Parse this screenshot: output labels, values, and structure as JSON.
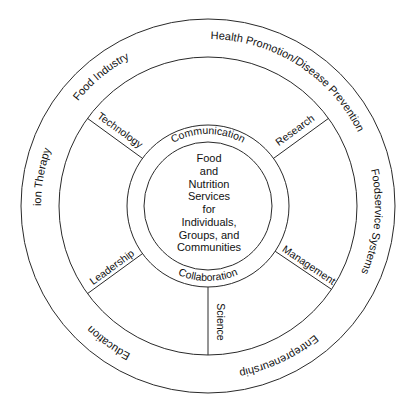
{
  "diagram": {
    "center": {
      "lines": [
        "Food",
        "and",
        "Nutrition",
        "Services",
        "for",
        "Individuals,",
        "Groups, and",
        "Communities"
      ]
    },
    "inner_ring": {
      "top": "Communication",
      "bottom": "Collaboration"
    },
    "spokes": [
      {
        "label": "Technology",
        "position": "upper-left"
      },
      {
        "label": "Research",
        "position": "upper-right"
      },
      {
        "label": "Management",
        "position": "lower-right"
      },
      {
        "label": "Science",
        "position": "bottom"
      },
      {
        "label": "Leadership",
        "position": "lower-left"
      }
    ],
    "outer_ring": [
      {
        "label": "Health Promotion/Disease Prevention",
        "position": "top-right"
      },
      {
        "label": "Foodservice Systems",
        "position": "right"
      },
      {
        "label": "Entrepreneurship",
        "position": "bottom-right"
      },
      {
        "label": "Education",
        "position": "bottom-left"
      },
      {
        "label": "Nutrition Therapy",
        "position": "left"
      },
      {
        "label": "Food Industry",
        "position": "upper-left"
      }
    ]
  }
}
